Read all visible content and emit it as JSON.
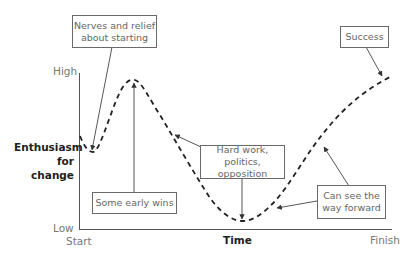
{
  "diagram": {
    "type": "change-curve",
    "y_axis": {
      "title_line1": "Enthusiasm",
      "title_line2": "for change",
      "high_label": "High",
      "low_label": "Low"
    },
    "x_axis": {
      "title": "Time",
      "start_label": "Start",
      "finish_label": "Finish"
    },
    "annotations": [
      {
        "id": "nerves",
        "line1": "Nerves and relief",
        "line2": "about starting"
      },
      {
        "id": "early-wins",
        "line1": "Some early wins",
        "line2": ""
      },
      {
        "id": "hard-work",
        "line1": "Hard work,",
        "line2": "politics, opposition"
      },
      {
        "id": "way-forward",
        "line1": "Can see the",
        "line2": "way forward"
      },
      {
        "id": "success",
        "line1": "Success",
        "line2": ""
      }
    ],
    "curve": {
      "style": "dashed",
      "color": "#222222",
      "description": "Starts mid, small dip, rises to early peak, falls to low trough, rises to high at finish"
    },
    "colors": {
      "axis": "#555555",
      "box_border": "#6a6a6a",
      "text": "#666666",
      "bold_text": "#222222"
    }
  }
}
